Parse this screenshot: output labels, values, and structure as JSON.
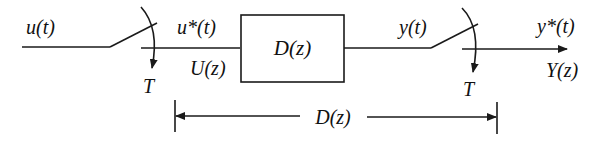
{
  "diagram": {
    "type": "sampled-data block diagram",
    "input_signal": "u(t)",
    "sampler_1": {
      "label": "T",
      "output_time": "u*(t)",
      "output_z": "U(z)"
    },
    "block": {
      "label": "D(z)"
    },
    "block_output": "y(t)",
    "sampler_2": {
      "label": "T",
      "output_time": "y*(t)",
      "output_z": "Y(z)"
    },
    "dimension": {
      "label": "D(z)"
    }
  }
}
